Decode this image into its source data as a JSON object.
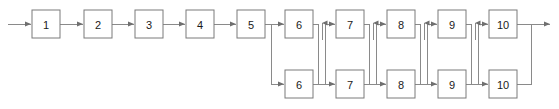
{
  "diagram": {
    "type": "block-flow",
    "background_color": "#ffffff",
    "box_stroke_color": "#7a7a7a",
    "box_fill_color": "#ffffff",
    "edge_color": "#8a8a8a",
    "arrowhead_color": "#6f6f6f",
    "label_color": "#1a1a1a",
    "geometry": {
      "box_width": 28,
      "box_height": 28,
      "top_row_y": 10,
      "bottom_row_y": 70,
      "top_row_center_y": 24,
      "bottom_row_center_y": 84,
      "canvas_width": 559,
      "canvas_height": 109
    },
    "serial_stages": [
      {
        "label": "1",
        "x": 32,
        "y": 10
      },
      {
        "label": "2",
        "x": 84,
        "y": 10
      },
      {
        "label": "3",
        "x": 135,
        "y": 10
      },
      {
        "label": "4",
        "x": 186,
        "y": 10
      },
      {
        "label": "5",
        "x": 237,
        "y": 10
      }
    ],
    "parallel_stages_top": [
      {
        "label": "6",
        "x": 285,
        "y": 10
      },
      {
        "label": "7",
        "x": 336,
        "y": 10
      },
      {
        "label": "8",
        "x": 387,
        "y": 10
      },
      {
        "label": "9",
        "x": 438,
        "y": 10
      },
      {
        "label": "10",
        "x": 489,
        "y": 10
      }
    ],
    "parallel_stages_bottom": [
      {
        "label": "6",
        "x": 285,
        "y": 70
      },
      {
        "label": "7",
        "x": 336,
        "y": 70
      },
      {
        "label": "8",
        "x": 387,
        "y": 70
      },
      {
        "label": "9",
        "x": 438,
        "y": 70
      },
      {
        "label": "10",
        "x": 489,
        "y": 70
      }
    ],
    "input_arrow": {
      "from_x": 8,
      "to_x": 32,
      "y": 24
    },
    "output_arrow": {
      "from_x": 517,
      "to_x": 551,
      "y": 24
    },
    "split_point_x": 271,
    "merge_point_x": 531,
    "stage_count_serial": 5,
    "stage_count_parallel": 5,
    "parallel_branch_count": 2
  }
}
